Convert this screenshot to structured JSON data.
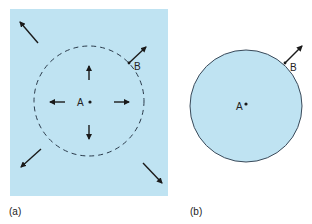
{
  "figure": {
    "panels": [
      {
        "id": "a",
        "caption": "(a)",
        "point_center": "A",
        "point_edge": "B",
        "fill_color": "#bfe3f2",
        "boundary": "dashed"
      },
      {
        "id": "b",
        "caption": "(b)",
        "point_center": "A",
        "point_edge": "B",
        "fill_color": "#bfe3f2",
        "boundary": "solid"
      }
    ]
  }
}
